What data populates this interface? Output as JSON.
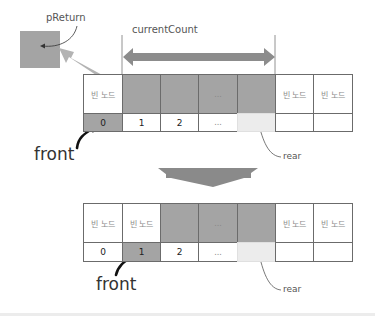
{
  "diagram": {
    "colors": {
      "occupied": "#a4a4a4",
      "empty": "#ffffff",
      "rear_cell": "#ececec",
      "arrow": "#8c8c8c",
      "border": "#6b6b6b"
    },
    "labels": {
      "preturn": "pReturn",
      "current_count": "currentCount",
      "front_top": "front",
      "rear_top": "rear",
      "front_bottom": "front",
      "rear_bottom": "rear"
    },
    "before": {
      "nodes": [
        "빈 노드",
        "",
        "",
        "...",
        "",
        "빈 노드",
        "빈 노드"
      ],
      "indices": [
        "0",
        "1",
        "2",
        "...",
        "",
        "",
        ""
      ],
      "front_index": 0,
      "rear_index": 4
    },
    "after": {
      "nodes": [
        "빈 노드",
        "빈 노드",
        "",
        "...",
        "",
        "빈 노드",
        "빈 노드"
      ],
      "indices": [
        "0",
        "1",
        "2",
        "...",
        "",
        "",
        ""
      ],
      "front_index": 1,
      "rear_index": 4
    }
  }
}
